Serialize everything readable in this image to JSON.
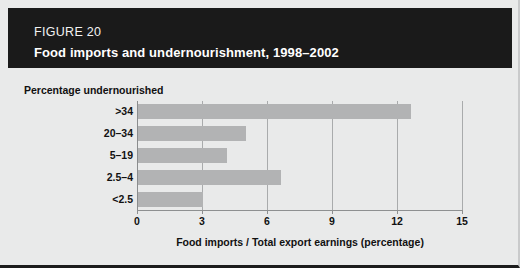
{
  "figure": {
    "number_label": "FIGURE 20",
    "title": "Food imports and undernourishment, 1998–2002",
    "header_background": "#1a1a1a",
    "panel_background": "#e9eaea",
    "bar_color": "#b2b3b4"
  },
  "chart_data": {
    "type": "bar",
    "orientation": "horizontal",
    "title": "Food imports and undernourishment, 1998–2002",
    "categories": [
      ">34",
      "20–34",
      "5–19",
      "2.5–4",
      "<2.5"
    ],
    "values": [
      12.6,
      5.0,
      4.1,
      6.6,
      3.0
    ],
    "ylabel": "Percentage undernourished",
    "xlabel": "Food imports / Total export earnings (percentage)",
    "xlim": [
      0,
      15
    ],
    "xticks": [
      0,
      3,
      6,
      9,
      12,
      15
    ],
    "xtick_labels": [
      "0",
      "3",
      "6",
      "9",
      "12",
      "15"
    ],
    "grid": "vertical",
    "legend": "none"
  }
}
